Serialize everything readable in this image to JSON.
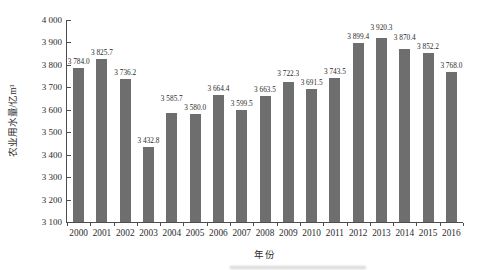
{
  "figure": {
    "y_axis_title": "农业用水量/亿m³",
    "x_axis_title": "年份"
  },
  "chart_data": {
    "type": "bar",
    "title": "",
    "xlabel": "年份",
    "ylabel": "农业用水量/亿m³",
    "categories": [
      "2000",
      "2001",
      "2002",
      "2003",
      "2004",
      "2005",
      "2006",
      "2007",
      "2008",
      "2009",
      "2010",
      "2011",
      "2012",
      "2013",
      "2014",
      "2015",
      "2016"
    ],
    "values": [
      3784.0,
      3825.7,
      3736.2,
      3432.8,
      3585.7,
      3580.0,
      3664.4,
      3599.5,
      3663.5,
      3722.3,
      3691.5,
      3743.5,
      3899.4,
      3920.3,
      3870.4,
      3852.2,
      3768.0
    ],
    "data_labels": [
      "3 784.0",
      "3 825.7",
      "3 736.2",
      "3 432.8",
      "3 585.7",
      "3 580.0",
      "3 664.4",
      "3 599.5",
      "3 663.5",
      "3 722.3",
      "3 691.5",
      "3 743.5",
      "3 899.4",
      "3 920.3",
      "3 870.4",
      "3 852.2",
      "3 768.0"
    ],
    "ylim": [
      3100,
      4000
    ],
    "ytick_step": 100,
    "ytick_labels": [
      "3 100",
      "3 200",
      "3 300",
      "3 400",
      "3 500",
      "3 600",
      "3 700",
      "3 800",
      "3 900",
      "4 000"
    ],
    "grid": false,
    "legend": "none",
    "bar_color": "#6e6e6e",
    "axis_color": "#4d4d4d",
    "text_color": "#2b2b2b",
    "background_color": "#ffffff"
  }
}
